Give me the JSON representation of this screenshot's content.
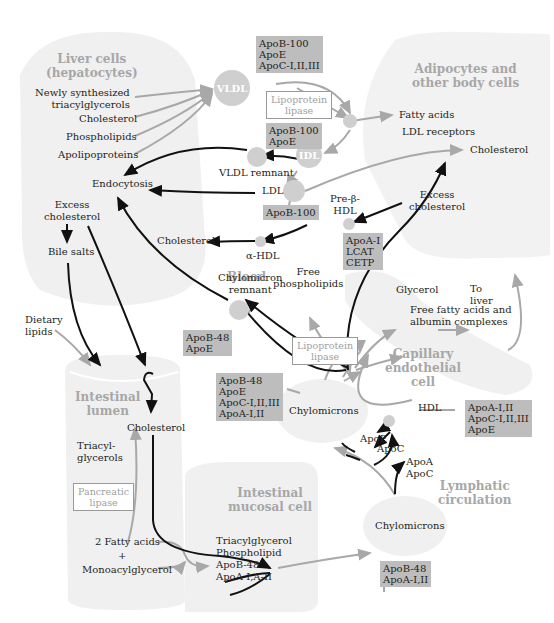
{
  "regions": {
    "liver": "Liver cells\n(hepatocytes)",
    "adipocytes": "Adipocytes and\nother body cells",
    "blood": "Blood",
    "capillary": "Capillary\nendothelial\ncell",
    "intestinal_lumen": "Intestinal\nlumen",
    "mucosal": "Intestinal\nmucosal cell",
    "lymphatic": "Lymphatic\ncirculation"
  },
  "liver_inputs": [
    "Newly synthesized\ntriacylglycerols",
    "Cholesterol",
    "Phospholipids",
    "Apolipoproteins"
  ],
  "nodes": {
    "vldl": "VLDL",
    "idl": "IDL"
  },
  "labels": {
    "vldl_remnant": "VLDL remnant",
    "endocytosis": "Endocytosis",
    "ldl": "LDL",
    "excess_cholesterol_liver": "Excess\ncholesterol",
    "bile_salts": "Bile salts",
    "cholesterol_hdl": "Cholesterol",
    "alpha_hdl": "α-HDL",
    "pre_beta_hdl": "Pre-β-\nHDL",
    "excess_cholesterol_body": "Excess\ncholesterol",
    "fatty_acids": "Fatty acids",
    "ldl_receptors": "LDL receptors",
    "cholesterol_body": "Cholesterol",
    "free_phospholipids": "Free\nphospholipids",
    "glycerol": "Glycerol",
    "to_liver": "To\nliver",
    "ffa_albumin": "Free fatty acids and\nalbumin complexes",
    "chylomicron_remnant": "Chylomicron\nremnant",
    "dietary_lipids": "Dietary\nlipids",
    "cholesterol_lumen": "Cholesterol",
    "triacylglycerols": "Triacyl-\nglycerols",
    "fatty_acids_2": "2 Fatty acids",
    "plus": "+",
    "monoacylglycerol": "Monoacylglycerol",
    "mucosal_products": "Triacylglycerol\nPhospholipid\nApoB-48\nApoA-I,A-II",
    "chylomicrons_blood": "Chylomicrons",
    "chylomicrons_lymph": "Chylomicrons",
    "hdl": "HDL",
    "apoe": "ApoE",
    "apoc": "ApoC",
    "apoa_apoc": "ApoA\nApoC"
  },
  "enzymes": {
    "lpl_top": "Lipoprotein\nlipase",
    "lpl_bottom": "Lipoprotein\nlipase",
    "pancreatic": "Pancreatic\nlipase"
  },
  "apo_boxes": {
    "vldl": "ApoB-100\nApoE\nApoC-I,II,III",
    "idl": "ApoB-100\nApoE",
    "ldl": "ApoB-100",
    "hdl_pre": "ApoA-I\nLCAT\nCETP",
    "chylo_remnant": "ApoB-48\nApoE",
    "chylo_blood": "ApoB-48\nApoE\nApoC-I,II,III\nApoA-I,II",
    "hdl": "ApoA-I,II\nApoC-I,II,III\nApoE",
    "chylo_lymph": "ApoB-48\nApoA-I,II"
  },
  "colors": {
    "region_fill": "#f0f0f0",
    "box_fill": "#bdbdbd",
    "node_fill": "#cfcfcf",
    "gray_arrow": "#a8a8a8",
    "black_arrow": "#111111",
    "region_label": "#a7a7a7"
  }
}
